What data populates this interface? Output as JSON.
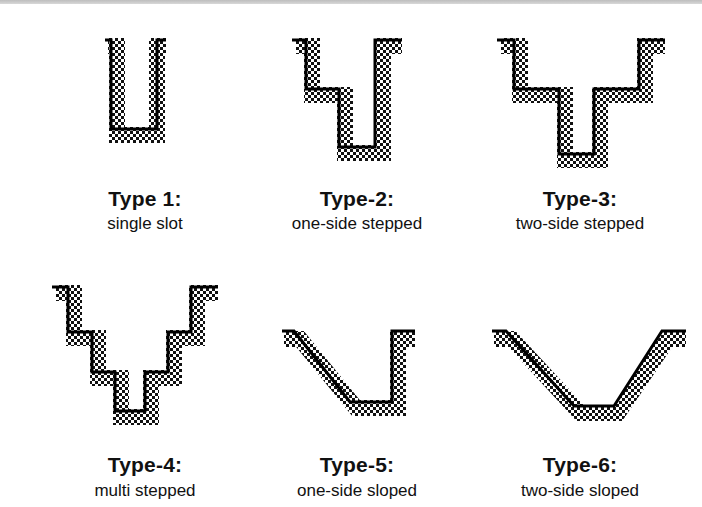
{
  "figure": {
    "colors": {
      "outline": "#000000",
      "pattern_dark": "#111111",
      "pattern_light": "#ffffff",
      "background": "#ffffff"
    },
    "types": [
      {
        "title": "Type 1:",
        "label": "single slot",
        "shape": "single-slot"
      },
      {
        "title": "Type-2:",
        "label": "one-side stepped",
        "shape": "one-side-stepped"
      },
      {
        "title": "Type-3:",
        "label": "two-side stepped",
        "shape": "two-side-stepped"
      },
      {
        "title": "Type-4:",
        "label": "multi stepped",
        "shape": "multi-stepped"
      },
      {
        "title": "Type-5:",
        "label": "one-side sloped",
        "shape": "one-side-sloped"
      },
      {
        "title": "Type-6:",
        "label": "two-side sloped",
        "shape": "two-side-sloped"
      }
    ]
  }
}
